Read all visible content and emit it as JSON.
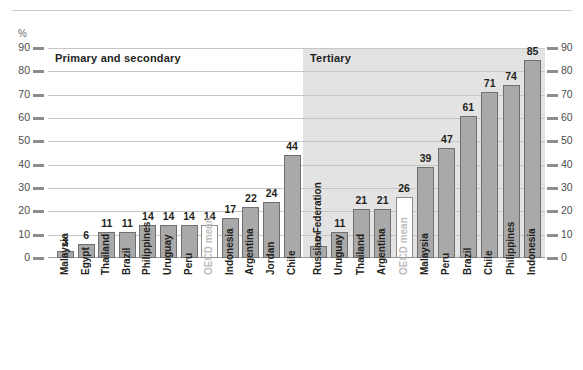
{
  "axis": {
    "unit_label": "%",
    "ticks": [
      0,
      10,
      20,
      30,
      40,
      50,
      60,
      70,
      80,
      90
    ]
  },
  "panels": {
    "primary": {
      "title": "Primary and secondary"
    },
    "tertiary": {
      "title": "Tertiary"
    }
  },
  "colors": {
    "bar_fill": "#a9a9a9",
    "bar_stroke": "#6f6f6f",
    "mean_fill": "#ffffff",
    "mean_label": "#bdbdbd",
    "tertiary_band": "#e3e3e3",
    "gridline": "#c6c6c6",
    "text": "#231f20"
  },
  "chart_data": {
    "type": "bar",
    "title": "",
    "subtitle": "",
    "xlabel": "",
    "ylabel": "%",
    "ylim": [
      0,
      90
    ],
    "yticks": [
      0,
      10,
      20,
      30,
      40,
      50,
      60,
      70,
      80,
      90
    ],
    "grid": true,
    "legend": "none",
    "panels": [
      {
        "name": "Primary and secondary",
        "categories": [
          "Malaysia",
          "Egypt",
          "Thailand",
          "Brazil",
          "Philippines",
          "Uruguay",
          "Peru",
          "OECD mean",
          "Indonesia",
          "Argentina",
          "Jordan",
          "Chile"
        ],
        "values": [
          3,
          6,
          11,
          11,
          14,
          14,
          14,
          14,
          17,
          22,
          24,
          44
        ],
        "highlight": [
          "OECD mean"
        ]
      },
      {
        "name": "Tertiary",
        "categories": [
          "Russian Federation",
          "Uruguay",
          "Thailand",
          "Argentina",
          "OECD mean",
          "Malaysia",
          "Peru",
          "Brazil",
          "Chile",
          "Philippines",
          "Indonesia"
        ],
        "values": [
          5,
          11,
          21,
          21,
          26,
          39,
          47,
          61,
          71,
          74,
          85
        ],
        "highlight": [
          "OECD mean"
        ]
      }
    ]
  }
}
